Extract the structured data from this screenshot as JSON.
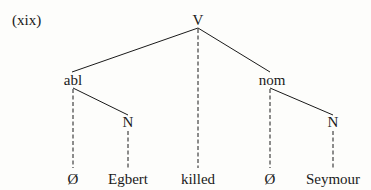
{
  "example_label": "(xix)",
  "tree": {
    "root": {
      "label": "V"
    },
    "nodes": {
      "abl": {
        "label": "abl"
      },
      "nom": {
        "label": "nom"
      },
      "n_left": {
        "label": "N"
      },
      "n_right": {
        "label": "N"
      }
    },
    "leaves": [
      {
        "label": "Ø"
      },
      {
        "label": "Egbert"
      },
      {
        "label": "killed"
      },
      {
        "label": "Ø"
      },
      {
        "label": "Seymour"
      }
    ],
    "edges": [
      {
        "from": "V",
        "to": "abl",
        "style": "solid"
      },
      {
        "from": "V",
        "to": "nom",
        "style": "solid"
      },
      {
        "from": "V",
        "to": "killed",
        "style": "dashed"
      },
      {
        "from": "abl",
        "to": "N",
        "style": "solid"
      },
      {
        "from": "abl",
        "to": "Ø",
        "style": "dashed"
      },
      {
        "from": "N",
        "to": "Egbert",
        "style": "dashed"
      },
      {
        "from": "nom",
        "to": "N",
        "style": "solid"
      },
      {
        "from": "nom",
        "to": "Ø",
        "style": "dashed"
      },
      {
        "from": "N",
        "to": "Seymour",
        "style": "dashed"
      }
    ]
  }
}
